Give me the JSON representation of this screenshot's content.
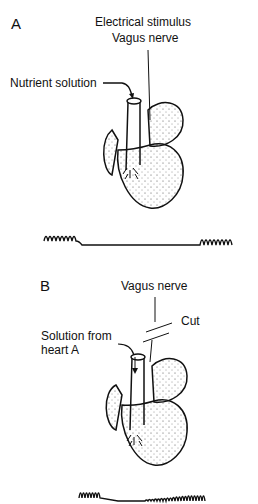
{
  "panel_a": {
    "letter": "A",
    "labels": {
      "stimulus": "Electrical stimulus",
      "nerve": "Vagus nerve",
      "nutrient": "Nutrient solution"
    },
    "trace": "heartbeat trace: rapid beats, flat pause during stimulation, then resumed beats"
  },
  "panel_b": {
    "letter": "B",
    "labels": {
      "nerve": "Vagus nerve",
      "cut": "Cut",
      "solution_line1": "Solution from",
      "solution_line2": "heart A"
    },
    "trace": "heartbeat trace: beats, brief slowing, then gradually recovering beats"
  },
  "colors": {
    "ink": "#111111",
    "background": "#ffffff"
  }
}
